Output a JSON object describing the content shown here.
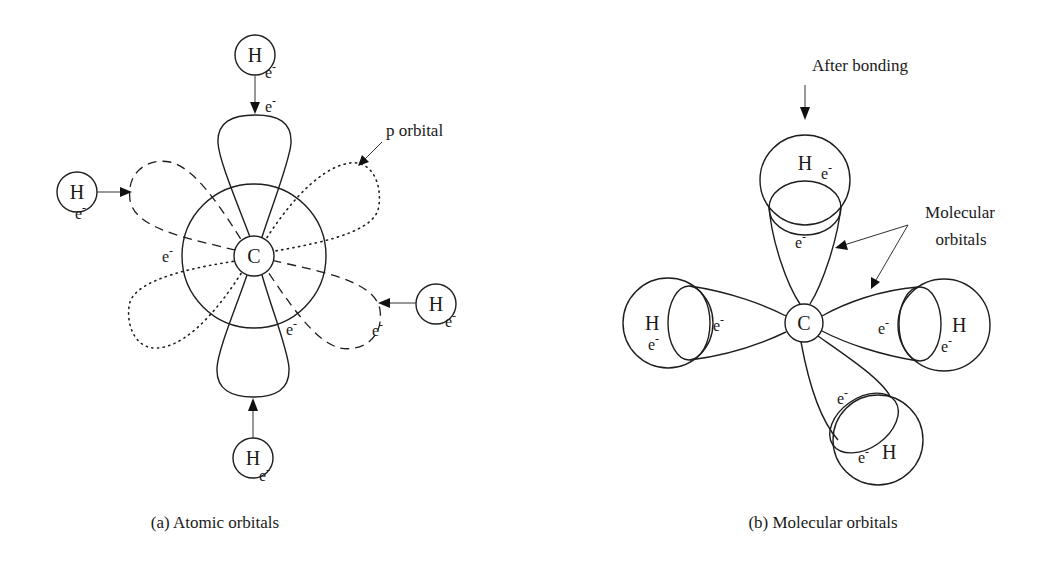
{
  "panel_a": {
    "caption": "(a) Atomic orbitals",
    "center_atom": "C",
    "annotation_p_orbital": "p orbital",
    "hydrogens": [
      {
        "position": "top",
        "label": "H",
        "electron": "e",
        "charge": "-"
      },
      {
        "position": "left",
        "label": "H",
        "electron": "e",
        "charge": "-"
      },
      {
        "position": "right",
        "label": "H",
        "electron": "e",
        "charge": "-"
      },
      {
        "position": "bottom",
        "label": "H",
        "electron": "e",
        "charge": "-"
      }
    ],
    "orbital_electrons": [
      {
        "position": "top-lobe",
        "electron": "e",
        "charge": "-"
      },
      {
        "position": "left",
        "electron": "e",
        "charge": "-"
      },
      {
        "position": "bottom-right-inner",
        "electron": "e",
        "charge": "-"
      },
      {
        "position": "right-dashed",
        "electron": "e",
        "charge": "-"
      }
    ],
    "line_styles": {
      "vertical_lobes": "solid",
      "diagonal_lobes_1": "dashed",
      "diagonal_lobes_2": "dotted"
    }
  },
  "panel_b": {
    "caption": "(b) Molecular orbitals",
    "center_atom": "C",
    "annotation_after_bonding": "After bonding",
    "annotation_molecular_orbitals_line1": "Molecular",
    "annotation_molecular_orbitals_line2": "orbitals",
    "hydrogens": [
      {
        "position": "top",
        "label": "H",
        "electron": "e",
        "charge": "-",
        "orbital_electron": "e"
      },
      {
        "position": "left",
        "label": "H",
        "electron": "e",
        "charge": "-",
        "orbital_electron": "e"
      },
      {
        "position": "right",
        "label": "H",
        "electron": "e",
        "charge": "-",
        "orbital_electron": "e"
      },
      {
        "position": "bottom",
        "label": "H",
        "electron": "e",
        "charge": "-",
        "orbital_electron": "e"
      }
    ]
  },
  "colors": {
    "ink": "#1e1e1e",
    "background": "#ffffff"
  }
}
